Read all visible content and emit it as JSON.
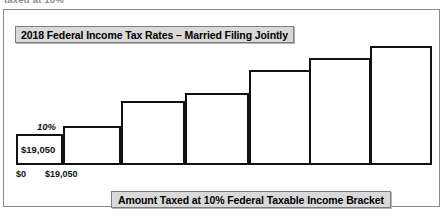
{
  "page": {
    "clipped_top_text": "taxed at 10%"
  },
  "figure": {
    "title": "2018 Federal Income Tax Rates – Married Filing Jointly",
    "caption": "Amount Taxed at 10% Federal Taxable Income Bracket",
    "rate_label": "10%",
    "bar_value_label": "$19,050",
    "axis_ticks": [
      "$0",
      "$19,050"
    ],
    "colors": {
      "bar_border": "#111111",
      "bar_fill": "#ffffff",
      "label_box_fill": "#d9d9d9",
      "label_box_border": "#7d7d7d",
      "frame_border": "#8a8a8a",
      "background": "#ffffff"
    }
  },
  "chart_data": {
    "type": "bar",
    "title": "2018 Federal Income Tax Rates – Married Filing Jointly",
    "xlabel": "Amount Taxed at 10% Federal Taxable Income Bracket",
    "ylabel": "",
    "grid": false,
    "legend": "none",
    "categories": [
      "1",
      "2",
      "3",
      "4",
      "5",
      "6",
      "7"
    ],
    "values": [
      30,
      38,
      63,
      71,
      94,
      106,
      118
    ],
    "annotations": [
      {
        "text": "10%",
        "target": "bar 1 top"
      },
      {
        "text": "$19,050",
        "target": "inside bar 1"
      },
      {
        "text": "$0",
        "target": "x-axis left of bar 1"
      },
      {
        "text": "$19,050",
        "target": "x-axis right of bar 1"
      }
    ]
  }
}
